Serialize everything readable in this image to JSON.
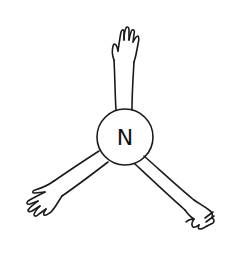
{
  "diagram": {
    "type": "hand-drawn atom with bonding arms",
    "atom": {
      "symbol": "N",
      "shape": "circle"
    },
    "arms": [
      {
        "position": "top",
        "hand": "open palm raised upward"
      },
      {
        "position": "bottom-left",
        "hand": "open hand reaching left"
      },
      {
        "position": "bottom-right",
        "hand": "open hand reaching right"
      }
    ],
    "arm_count": 3,
    "colors": {
      "ink": "#1a1a1a",
      "background": "#ffffff"
    }
  }
}
